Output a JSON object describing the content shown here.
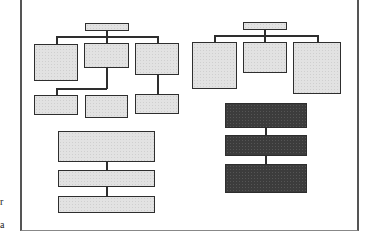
{
  "figure": {
    "left_tree": {
      "root": {
        "label": ""
      },
      "children": [
        {
          "label": "",
          "fill": "light"
        },
        {
          "label": "",
          "fill": "light",
          "children": [
            {
              "label": ""
            },
            {
              "label": ""
            }
          ]
        },
        {
          "label": "",
          "fill": "light",
          "children": [
            {
              "label": ""
            }
          ]
        }
      ]
    },
    "right_tree": {
      "root": {
        "label": ""
      },
      "children": [
        {
          "label": "",
          "fill": "light"
        },
        {
          "label": "",
          "fill": "light"
        },
        {
          "label": "",
          "fill": "light"
        }
      ]
    },
    "left_stack": {
      "fill": "light",
      "boxes": 3
    },
    "right_stack": {
      "fill": "dark",
      "boxes": 3
    },
    "colors": {
      "light_fill": "#e2e2e2",
      "dark_fill": "#3c3c3c",
      "stroke": "#2e2e2e",
      "frame": "#555555"
    },
    "edge_text_fragments": [
      "r",
      "a"
    ]
  }
}
